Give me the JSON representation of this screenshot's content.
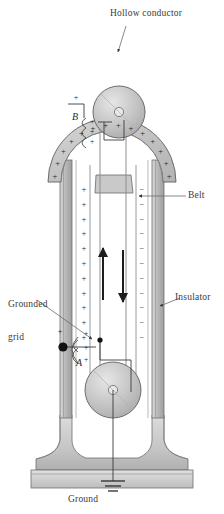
{
  "figure": {
    "type": "physics-diagram",
    "background_color": "#ffffff",
    "ink_color": "#2b2b2b",
    "metal_fill": "#c9c9c9",
    "metal_light": "#e2e2e2",
    "belt_color": "#9a9a9a"
  },
  "labels": {
    "hollow_conductor": "Hollow conductor",
    "belt": "Belt",
    "insulator": "Insulator",
    "grounded_grid_line1": "Grounded",
    "grounded_grid_line2": "grid",
    "ground": "Ground"
  },
  "symbols": {
    "brush_upper": "B",
    "brush_lower": "A"
  },
  "charges": {
    "positive_sign": "+",
    "negative_sign": "−",
    "dome_positive_count": 14,
    "belt_left_positive_count": 11,
    "belt_right_negative_count": 11,
    "brush_upper_positive_count": 3,
    "brush_lower_positive_count": 3,
    "stray_positive_count": 2
  },
  "arrows": {
    "belt_up_direction": "up",
    "belt_down_direction": "down"
  },
  "components": [
    {
      "name": "hollow-conductor-dome",
      "shape": "annulus"
    },
    {
      "name": "upper-pulley",
      "shape": "disc"
    },
    {
      "name": "lower-pulley",
      "shape": "disc"
    },
    {
      "name": "insulating-column-left",
      "shape": "column"
    },
    {
      "name": "insulating-column-right",
      "shape": "column"
    },
    {
      "name": "belt",
      "shape": "loop"
    },
    {
      "name": "base-pedestal",
      "shape": "flared-base"
    },
    {
      "name": "ground-symbol",
      "shape": "earth-ground"
    }
  ]
}
